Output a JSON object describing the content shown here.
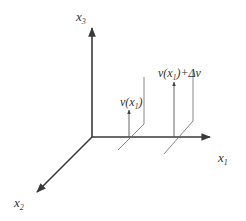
{
  "diagram": {
    "type": "3d-coordinate-axes",
    "axes": {
      "x1": {
        "name": "x",
        "sub": "1"
      },
      "x2": {
        "name": "x",
        "sub": "2"
      },
      "x3": {
        "name": "x",
        "sub": "3"
      }
    },
    "vectors": [
      {
        "label_prefix": "v(x",
        "label_sub": "1",
        "label_suffix": ")"
      },
      {
        "label_prefix": "v(x",
        "label_sub": "1",
        "label_suffix": ")+",
        "label_delta": "Δv"
      }
    ],
    "colors": {
      "axis": "#3a3a3a",
      "plane": "#6a6a6a",
      "vector": "#555555",
      "text": "#333333",
      "background": "#ffffff"
    }
  }
}
